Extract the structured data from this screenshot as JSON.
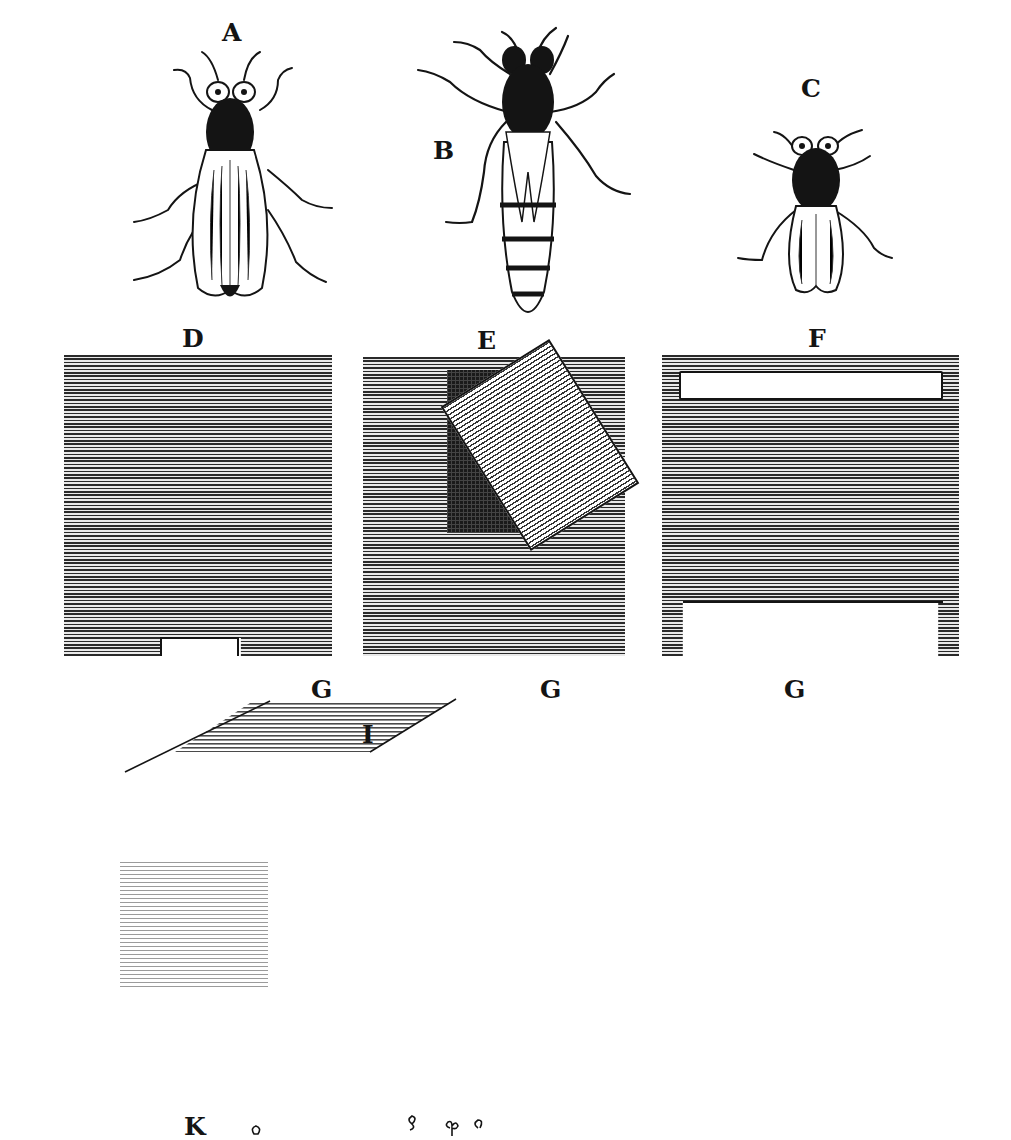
{
  "plate": {
    "type": "engraved illustration plate",
    "subject": "bees and hive boards",
    "figures": [
      {
        "label": "A",
        "description": "bee with broad wings (drone-like), top view"
      },
      {
        "label": "B",
        "description": "long-bodied bee with striped abdomen (queen-like), top view"
      },
      {
        "label": "C",
        "description": "small bee (worker-like), top view"
      },
      {
        "label": "D",
        "description": "hive board with small entrance notch at bottom"
      },
      {
        "label": "E",
        "description": "hive board with dark window covered by tilted shutter"
      },
      {
        "label": "F",
        "description": "hive board with horizontal slot at top and wide opening at bottom"
      },
      {
        "label": "G",
        "description": "label under board D"
      },
      {
        "label": "G",
        "description": "label under board E"
      },
      {
        "label": "G",
        "description": "label under board F"
      },
      {
        "label": "I",
        "description": "sloped alighting board"
      },
      {
        "label": "K",
        "description": "label at bottom with small bee glyphs"
      }
    ]
  },
  "labels": {
    "a": "A",
    "b": "B",
    "c": "C",
    "d": "D",
    "e": "E",
    "f": "F",
    "g1": "G",
    "g2": "G",
    "g3": "G",
    "i": "I",
    "k": "K"
  },
  "colors": {
    "ink": "#141414",
    "paper": "#ffffff",
    "hatch_dark": "#2a2a2a",
    "hatch_light": "#e9e9e9"
  }
}
